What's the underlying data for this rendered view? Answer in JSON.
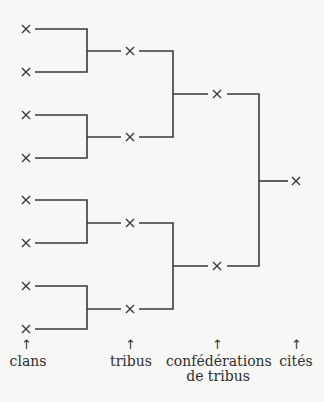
{
  "diagram": {
    "type": "tree",
    "node_symbol": "×",
    "levels": [
      {
        "label": "clans",
        "count": 8
      },
      {
        "label": "tribus",
        "count": 4
      },
      {
        "label": "confédérations de tribus",
        "count": 2
      },
      {
        "label": "cités",
        "count": 1
      }
    ],
    "labels": {
      "clans": "clans",
      "tribus": "tribus",
      "confederations_line1": "confédérations",
      "confederations_line2": "de tribus",
      "cites": "cités"
    },
    "arrow_glyph": "↑",
    "colors": {
      "line": "#3a3a3a",
      "background": "#f7f7f6"
    }
  }
}
